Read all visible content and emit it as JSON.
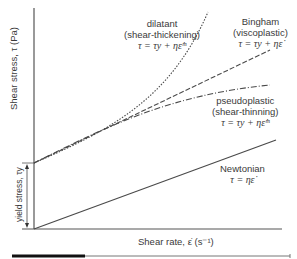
{
  "diagram": {
    "y_axis_label": "Shear stress, τ (Pa)",
    "x_axis_label": "Shear rate, ε̇ (s⁻¹)",
    "yield_label": "yield stress, τy",
    "curves": [
      {
        "id": "dilatant",
        "name": "dilatant",
        "subname": "(shear-thickening)",
        "equation": "τ = τy + ηε̇ᵐ",
        "style": "dotted"
      },
      {
        "id": "bingham",
        "name": "Bingham",
        "subname": "(viscoplastic)",
        "equation": "τ = τy + ηε̇",
        "style": "dashed"
      },
      {
        "id": "pseudoplastic",
        "name": "pseudoplastic",
        "subname": "(shear-thinning)",
        "equation": "τ = τy + ηε̇ᵐ",
        "style": "dash-dot"
      },
      {
        "id": "newtonian",
        "name": "Newtonian",
        "subname": "",
        "equation": "τ = ηε̇",
        "style": "solid"
      }
    ],
    "colors": {
      "line": "#4a4a4a",
      "axis": "#555555",
      "bar_dark": "#111111",
      "bar_light": "#777777"
    }
  }
}
